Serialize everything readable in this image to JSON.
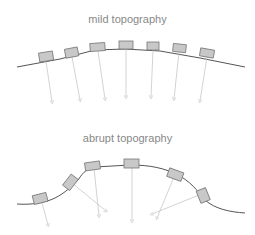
{
  "panels": [
    {
      "title": "mild topography",
      "description": "sensor boxes on gently curving terrain with near-vertical downward vectors"
    },
    {
      "title": "abrupt topography",
      "description": "sensor boxes on steep terrain with tilted vectors converging/crossing"
    }
  ],
  "colors": {
    "surface": "#555555",
    "box_fill": "#c8c8c8",
    "box_stroke": "#777777",
    "vector": "#c8c8c8",
    "title": "#888888"
  }
}
